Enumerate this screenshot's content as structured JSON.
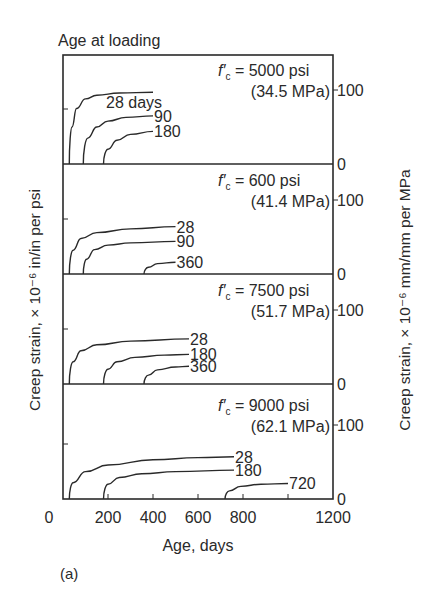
{
  "chart_data": {
    "type": "line",
    "figure_label": "(a)",
    "title": "Age at loading",
    "xlabel": "Age, days",
    "ylabel_left": "Creep strain, × 10⁻⁶ in/in per psi",
    "ylabel_right": "Creep strain, × 10⁻⁶ mm/mm per MPa",
    "xlim": [
      0,
      1200
    ],
    "x_ticks": [
      0,
      200,
      400,
      600,
      800,
      1000,
      1200
    ],
    "x_tick_labels": [
      "0",
      "200",
      "400",
      "600",
      "800",
      "",
      "1200"
    ],
    "right_y_tick_labels": [
      "0",
      "100"
    ],
    "grid": false,
    "panels": [
      {
        "fc_label": "f′c = 5000 psi",
        "fc_psi": "5000 psi",
        "fc_mpa": "(34.5 MPa)",
        "series": [
          {
            "name": "28 days",
            "label": "28 days",
            "age_at_loading": 28,
            "x": [
              28,
              40,
              60,
              100,
              150,
              250,
              400
            ],
            "y": [
              0,
              50,
              75,
              88,
              93,
              96,
              97
            ]
          },
          {
            "name": "90",
            "label": "90",
            "age_at_loading": 90,
            "x": [
              90,
              110,
              150,
              200,
              280,
              400
            ],
            "y": [
              0,
              35,
              50,
              58,
              63,
              65
            ]
          },
          {
            "name": "180",
            "label": "180",
            "age_at_loading": 180,
            "x": [
              180,
              200,
              240,
              300,
              400
            ],
            "y": [
              0,
              20,
              32,
              40,
              44
            ]
          }
        ]
      },
      {
        "fc_label": "f′c = 600 psi",
        "fc_psi": "600 psi",
        "fc_mpa": "(41.4 MPa)",
        "series": [
          {
            "name": "28",
            "label": "28",
            "age_at_loading": 28,
            "x": [
              28,
              45,
              80,
              150,
              300,
              500
            ],
            "y": [
              0,
              32,
              48,
              56,
              61,
              64
            ]
          },
          {
            "name": "90",
            "label": "90",
            "age_at_loading": 90,
            "x": [
              90,
              105,
              140,
              200,
              300,
              500
            ],
            "y": [
              0,
              20,
              33,
              39,
              42,
              44
            ]
          },
          {
            "name": "360",
            "label": "360",
            "age_at_loading": 360,
            "x": [
              360,
              380,
              420,
              500
            ],
            "y": [
              0,
              9,
              14,
              16
            ]
          }
        ]
      },
      {
        "fc_label": "f′c = 7500 psi",
        "fc_psi": "7500 psi",
        "fc_mpa": "(51.7 MPa)",
        "series": [
          {
            "name": "28",
            "label": "28",
            "age_at_loading": 28,
            "x": [
              28,
              45,
              80,
              150,
              300,
              560
            ],
            "y": [
              0,
              30,
              45,
              53,
              58,
              61
            ]
          },
          {
            "name": "180",
            "label": "180",
            "age_at_loading": 180,
            "x": [
              180,
              200,
              240,
              320,
              450,
              560
            ],
            "y": [
              0,
              20,
              30,
              36,
              39,
              40
            ]
          },
          {
            "name": "360",
            "label": "360",
            "age_at_loading": 360,
            "x": [
              360,
              380,
              420,
              500,
              560
            ],
            "y": [
              0,
              12,
              19,
              23,
              24
            ]
          }
        ]
      },
      {
        "fc_label": "f′c = 9000 psi",
        "fc_psi": "9000 psi",
        "fc_mpa": "(62.1 MPa)",
        "series": [
          {
            "name": "28",
            "label": "28",
            "age_at_loading": 28,
            "x": [
              28,
              45,
              100,
              200,
              400,
              600,
              760
            ],
            "y": [
              0,
              22,
              37,
              46,
              53,
              56,
              57
            ]
          },
          {
            "name": "180",
            "label": "180",
            "age_at_loading": 180,
            "x": [
              180,
              200,
              250,
              350,
              500,
              760
            ],
            "y": [
              0,
              20,
              29,
              34,
              37,
              39
            ]
          },
          {
            "name": "720",
            "label": "720",
            "age_at_loading": 720,
            "x": [
              720,
              740,
              790,
              880,
              1000
            ],
            "y": [
              0,
              11,
              17,
              20,
              21
            ]
          }
        ]
      }
    ]
  }
}
